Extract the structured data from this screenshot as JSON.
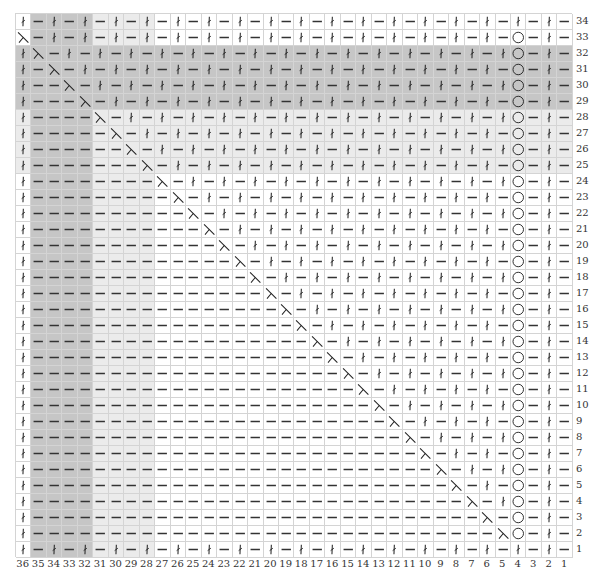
{
  "chart": {
    "title": "",
    "columns": 36,
    "rows": 34,
    "symbol_legend": {
      "k": "twisted-knit-stitch",
      "p": "purl-stitch",
      "d": "decrease",
      "o": "yarn-over"
    },
    "shade_colors": {
      "W": "#ffffff",
      "L": "#ebebeb",
      "D": "#c6c6c6"
    },
    "row_numbers": [
      "34",
      "33",
      "32",
      "31",
      "30",
      "29",
      "28",
      "27",
      "26",
      "25",
      "24",
      "23",
      "22",
      "21",
      "20",
      "19",
      "18",
      "17",
      "16",
      "15",
      "14",
      "13",
      "12",
      "11",
      "10",
      "9",
      "8",
      "7",
      "6",
      "5",
      "4",
      "3",
      "2",
      "1"
    ],
    "column_numbers": [
      "36",
      "35",
      "34",
      "33",
      "32",
      "31",
      "30",
      "29",
      "28",
      "27",
      "26",
      "25",
      "24",
      "23",
      "22",
      "21",
      "20",
      "19",
      "18",
      "17",
      "16",
      "15",
      "14",
      "13",
      "12",
      "11",
      "10",
      "9",
      "8",
      "7",
      "6",
      "5",
      "4",
      "3",
      "2",
      "1"
    ],
    "grid_rows": [
      {
        "row": "34",
        "stitches": "kpkpkpkpkpkpkpkpkpkpkpkpkpkpkpkpkpkp",
        "shade": "WDDDDLLLLWWWWWWWWWWWWWWWWWWWWWWWWWWW"
      },
      {
        "row": "33",
        "stitches": "dpkpkpkpkpkpkpkpkpkpkpkpkpkpkpkpopkp",
        "shade": "WDDDDLLLLWWWWWWWWWWWWWWWWWWWWWWWWWWW"
      },
      {
        "row": "32",
        "stitches": "kdpkpkpkpkpkpkpkpkpkpkpkpkpkpkpkopkp",
        "shade": "DDDDDDDDDDDDDDDDDDDDDDDDDDDDDDDDDDDD"
      },
      {
        "row": "31",
        "stitches": "kpdpkpkpkpkpkpkpkpkpkpkpkpkpkpkpopkp",
        "shade": "DDDDDDDDDDDDDDDDDDDDDDDDDDDDDDDDDDDD"
      },
      {
        "row": "30",
        "stitches": "kppdpkpkpkpkpkpkpkpkpkpkpkpkpkpkopkp",
        "shade": "DDDDDDDDDDDDDDDDDDDDDDDDDDDDDDDDDDDD"
      },
      {
        "row": "29",
        "stitches": "kpppdpkpkpkpkpkpkpkpkpkpkpkpkpkpopkp",
        "shade": "DDDDDDDDDDDDDDDDDDDDDDDDDDDDDDDDDDDD"
      },
      {
        "row": "28",
        "stitches": "kppppdpkpkpkpkpkpkpkpkpkpkpkpkpkopkp",
        "shade": "LDDDDLLLLLLLLLLLLLLLLLLLLLLLLLLLLLLL"
      },
      {
        "row": "27",
        "stitches": "kpppppdpkpkpkpkpkpkpkpkpkpkpkpkpopkp",
        "shade": "LDDDDLLLLLLLLLLLLLLLLLLLLLLLLLLLLLLL"
      },
      {
        "row": "26",
        "stitches": "kppppppdpkpkpkpkpkpkpkpkpkpkpkpkopkp",
        "shade": "LDDDDLLLLLLLLLLLLLLLLLLLLLLLLLLLLLLL"
      },
      {
        "row": "25",
        "stitches": "kpppppppdpkpkpkpkpkpkpkpkpkpkpkpopkp",
        "shade": "LDDDDLLLLLLLLLLLLLLLLLLLLLLLLLLLLLLL"
      },
      {
        "row": "24",
        "stitches": "kppppppppdpkpkpkpkpkpkpkpkpkpkpkopkp",
        "shade": "WDDDDLLLLWWWWWWWWWWWWWWWWWWWWWWWWWWW"
      },
      {
        "row": "23",
        "stitches": "kpppppppppdpkpkpkpkpkpkpkpkpkpkpopkp",
        "shade": "WDDDDLLLLWWWWWWWWWWWWWWWWWWWWWWWWWWW"
      },
      {
        "row": "22",
        "stitches": "kppppppppppdpkpkpkpkpkpkpkpkpkpkopkp",
        "shade": "WDDDDLLLLWWWWWWWWWWWWWWWWWWWWWWWWWWW"
      },
      {
        "row": "21",
        "stitches": "kpppppppppppdpkpkpkpkpkpkpkpkpkpopkp",
        "shade": "WDDDDLLLLWWWWWWWWWWWWWWWWWWWWWWWWWWW"
      },
      {
        "row": "20",
        "stitches": "kppppppppppppdpkpkpkpkpkpkpkpkpkopkp",
        "shade": "WDDDDLLLLWWWWWWWWWWWWWWWWWWWWWWWWWWW"
      },
      {
        "row": "19",
        "stitches": "kpppppppppppppdpkpkpkpkpkpkpkpkpopkp",
        "shade": "WDDDDLLLLWWWWWWWWWWWWWWWWWWWWWWWWWWW"
      },
      {
        "row": "18",
        "stitches": "kppppppppppppppdpkpkpkpkpkpkpkpkopkp",
        "shade": "WDDDDLLLLWWWWWWWWWWWWWWWWWWWWWWWWWWW"
      },
      {
        "row": "17",
        "stitches": "kpppppppppppppppdpkpkpkpkpkpkpkpopkp",
        "shade": "WDDDDLLLLWWWWWWWWWWWWWWWWWWWWWWWWWWW"
      },
      {
        "row": "16",
        "stitches": "kppppppppppppppppdpkpkpkpkpkpkpkopkp",
        "shade": "WDDDDLLLLWWWWWWWWWWWWWWWWWWWWWWWWWWW"
      },
      {
        "row": "15",
        "stitches": "kpppppppppppppppppdpkpkpkpkpkpkpopkp",
        "shade": "WDDDDLLLLWWWWWWWWWWWWWWWWWWWWWWWWWWW"
      },
      {
        "row": "14",
        "stitches": "kppppppppppppppppppdpkpkpkpkpkpkopkp",
        "shade": "WDDDDLLLLWWWWWWWWWWWWWWWWWWWWWWWWWWW"
      },
      {
        "row": "13",
        "stitches": "kpppppppppppppppppppdpkpkpkpkpkpopkp",
        "shade": "WDDDDLLLLWWWWWWWWWWWWWWWWWWWWWWWWWWW"
      },
      {
        "row": "12",
        "stitches": "kppppppppppppppppppppdpkpkpkpkpkopkp",
        "shade": "WDDDDLLLLWWWWWWWWWWWWWWWWWWWWWWWWWWW"
      },
      {
        "row": "11",
        "stitches": "kpppppppppppppppppppppdpkpkpkpkpopkp",
        "shade": "WDDDDLLLLWWWWWWWWWWWWWWWWWWWWWWWWWWW"
      },
      {
        "row": "10",
        "stitches": "kppppppppppppppppppppppdpkpkpkpkopkp",
        "shade": "WDDDDLLLLWWWWWWWWWWWWWWWWWWWWWWWWWWW"
      },
      {
        "row": "9",
        "stitches": "kpppppppppppppppppppppppdpkpkpkpopkp",
        "shade": "WDDDDLLLLWWWWWWWWWWWWWWWWWWWWWWWWWWW"
      },
      {
        "row": "8",
        "stitches": "kppppppppppppppppppppppppdpkpkpkopkp",
        "shade": "WDDDDLLLLWWWWWWWWWWWWWWWWWWWWWWWWWWW"
      },
      {
        "row": "7",
        "stitches": "kpppppppppppppppppppppppppdpkpkpopkp",
        "shade": "WDDDDLLLLWWWWWWWWWWWWWWWWWWWWWWWWWWW"
      },
      {
        "row": "6",
        "stitches": "kppppppppppppppppppppppppppdpkpkopkp",
        "shade": "WDDDDLLLLWWWWWWWWWWWWWWWWWWWWWWWWWWW"
      },
      {
        "row": "5",
        "stitches": "kpppppppppppppppppppppppppppdpkpopkp",
        "shade": "WDDDDLLLLWWWWWWWWWWWWWWWWWWWWWWWWWWW"
      },
      {
        "row": "4",
        "stitches": "kppppppppppppppppppppppppppppdpkopkp",
        "shade": "WDDDDLLLLWWWWWWWWWWWWWWWWWWWWWWWWWWW"
      },
      {
        "row": "3",
        "stitches": "kpppppppppppppppppppppppppppppdpopkp",
        "shade": "WDDDDLLLLWWWWWWWWWWWWWWWWWWWWWWWWWWW"
      },
      {
        "row": "2",
        "stitches": "kppppppppppppppppppppppppppppppdopkp",
        "shade": "WDDDDLLLLWWWWWWWWWWWWWWWWWWWWWWWWWWW"
      },
      {
        "row": "1",
        "stitches": "kpkpkpkpkpkpkpkpkpkpkpkpkpkpkpkpkpkp",
        "shade": "WDDDDLLLLWWWWWWWWWWWWWWWWWWWWWWWWWWW"
      }
    ]
  }
}
